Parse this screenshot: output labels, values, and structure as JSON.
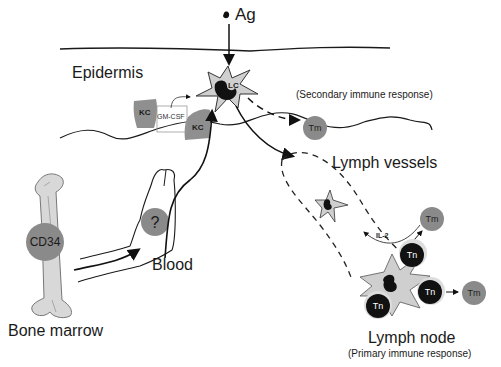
{
  "diagram": {
    "labels": {
      "antigen": "Ag",
      "epidermis": "Epidermis",
      "langerhans_cell": "LC",
      "keratinocyte": "KC",
      "gm_csf": "GM-CSF",
      "secondary_response": "(Secondary immune response)",
      "memory_t_cell": "Tm",
      "lymph_vessels": "Lymph vessels",
      "il2": "IL-2",
      "naive_t_cell": "Tn",
      "lymph_node": "Lymph node",
      "primary_response": "(Primary immune response)",
      "precursor": "?",
      "blood": "Blood",
      "cd34": "CD34",
      "bone_marrow": "Bone marrow"
    },
    "colors": {
      "line": "#1a1a1a",
      "cell_fill": "#c8c8c8",
      "lc_fill": "#cfcfcf",
      "nucleus": "#111111",
      "tm_fill": "#8a8a8a",
      "kc_fill": "#8f8f8f",
      "tn_fill": "#111111",
      "bone": "#d8d8d8"
    }
  }
}
